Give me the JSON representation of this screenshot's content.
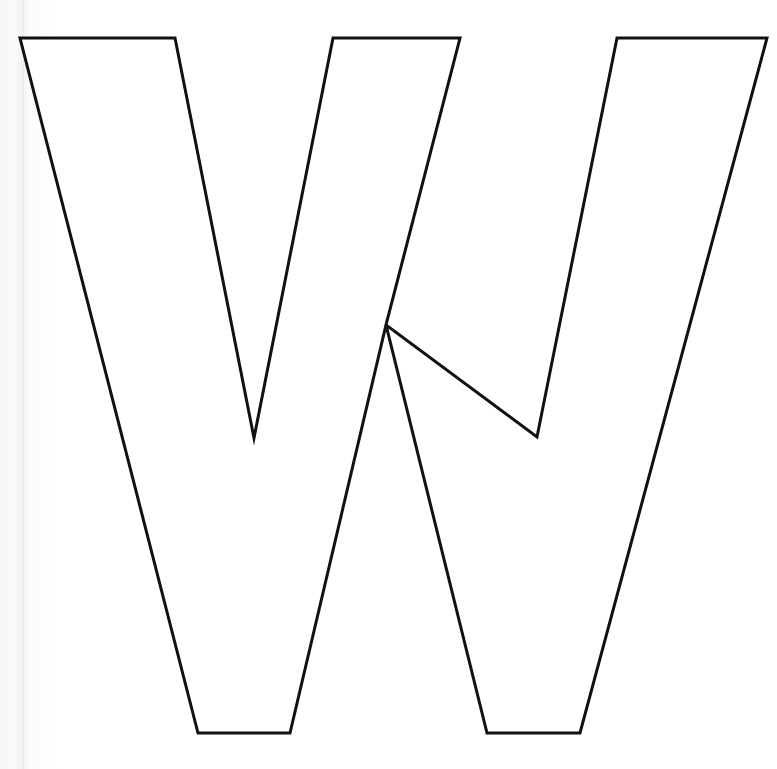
{
  "page": {
    "width": 777,
    "height": 769,
    "background_color": "#ffffff",
    "paper_tint_color": "#f7f7f7",
    "page_edge_line_color": "#eaeaea"
  },
  "artwork": {
    "name": "letter-w-outline",
    "character": "W",
    "style": "outline",
    "fill_color": "#ffffff",
    "stroke_color": "#111111",
    "stroke_width": 3,
    "vertices": [
      [
        20,
        38
      ],
      [
        175,
        38
      ],
      [
        254,
        438
      ],
      [
        333,
        38
      ],
      [
        460,
        38
      ],
      [
        386,
        325
      ],
      [
        537,
        437
      ],
      [
        617,
        38
      ],
      [
        767,
        38
      ],
      [
        580,
        733
      ],
      [
        487,
        733
      ],
      [
        386,
        325
      ],
      [
        290,
        733
      ],
      [
        198,
        733
      ]
    ],
    "path": "M 20 38 L 175 38 L 254 438 L 333 38 L 460 38 L 386 325 L 537 437 L 617 38 L 767 38 L 580 733 L 487 733 L 386 325 L 290 733 L 198 733 Z",
    "key_points": {
      "top_left_corner": [
        20,
        38
      ],
      "top_segment_1_right": [
        175,
        38
      ],
      "left_inner_valley": [
        254,
        438
      ],
      "top_segment_2_left": [
        333,
        38
      ],
      "top_segment_2_right": [
        460,
        38
      ],
      "middle_peak": [
        386,
        325
      ],
      "right_inner_valley": [
        537,
        437
      ],
      "top_segment_3_left": [
        617,
        38
      ],
      "top_right_corner": [
        767,
        38
      ],
      "right_foot_right": [
        580,
        733
      ],
      "right_foot_left": [
        487,
        733
      ],
      "left_foot_right": [
        290,
        733
      ],
      "left_foot_left": [
        198,
        733
      ]
    }
  }
}
